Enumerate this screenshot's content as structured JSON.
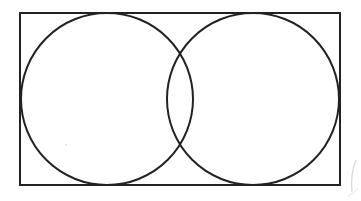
{
  "diagram": {
    "type": "venn",
    "sets_count": 2,
    "universe": {
      "shape": "rectangle",
      "x": 20,
      "y": 13,
      "width": 320,
      "height": 172,
      "label": ""
    },
    "sets": [
      {
        "name": "left-set",
        "cx": 107,
        "cy": 99,
        "r": 86,
        "label": ""
      },
      {
        "name": "right-set",
        "cx": 253,
        "cy": 99,
        "r": 86,
        "label": ""
      }
    ],
    "colors": {
      "stroke": "#222222",
      "background": "#ffffff",
      "fill": "none"
    },
    "stroke_width": 2
  }
}
